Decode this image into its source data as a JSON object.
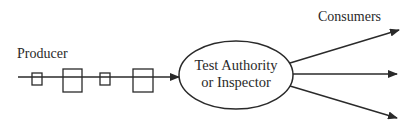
{
  "diagram": {
    "producer_label": "Producer",
    "consumers_label": "Consumers",
    "central_node": {
      "line1": "Test Authority",
      "line2": "or Inspector"
    },
    "flow_items": [
      {
        "size": "small"
      },
      {
        "size": "large"
      },
      {
        "size": "small"
      },
      {
        "size": "large"
      }
    ],
    "outgoing_arrows": 3,
    "colors": {
      "stroke": "#2a2a2a",
      "background": "#ffffff"
    }
  }
}
